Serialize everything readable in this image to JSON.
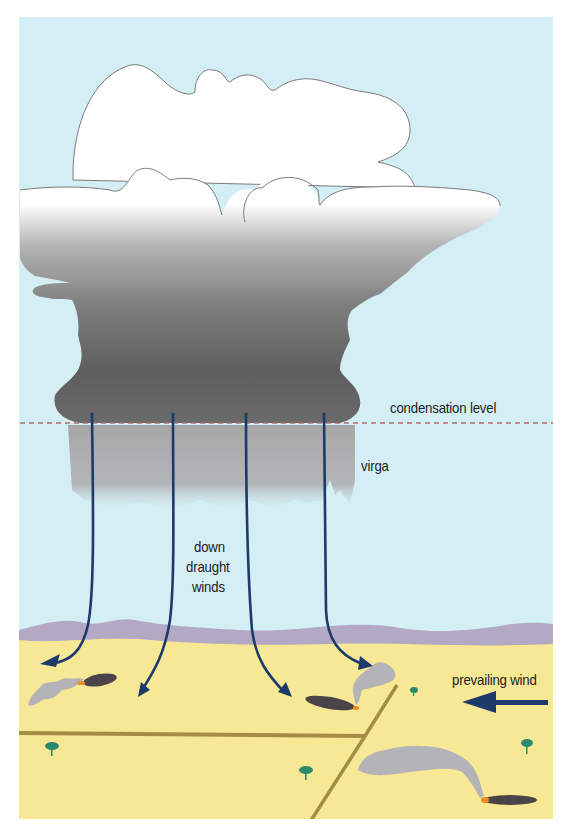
{
  "diagram": {
    "labels": {
      "condensation_level": "condensation level",
      "virga": "virga",
      "down_draught_winds_line1": "down",
      "down_draught_winds_line2": "draught",
      "down_draught_winds_line3": "winds",
      "prevailing_wind": "prevailing wind"
    },
    "colors": {
      "sky": "#d4eef5",
      "cloud_top": "#ffffff",
      "cloud_dark": "#6b6b6b",
      "virga": "#a9a9a9",
      "ground": "#f7e895",
      "hills": "#b3a9c4",
      "arrow": "#1d3a6b",
      "road": "#a38d45",
      "smoke": "#b4b4b8",
      "burn_scar": "#4a4348",
      "fire": "#f08a24",
      "tree": "#2a8a6a",
      "condensation_line": "#b86a6a"
    }
  }
}
